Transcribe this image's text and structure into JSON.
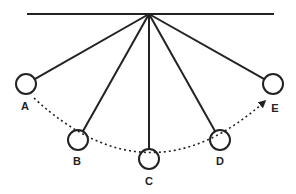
{
  "diagram": {
    "title": "",
    "colors": {
      "line": "#222222",
      "background": "#ffffff"
    },
    "ceiling": {
      "x1": 27,
      "y1": 14,
      "x2": 274,
      "y2": 14
    },
    "pivot": {
      "x": 149,
      "y": 14
    },
    "bob_radius": 10,
    "positions": [
      {
        "id": "A",
        "label": "A",
        "cx": 26,
        "cy": 84,
        "label_x": 25,
        "label_y": 110
      },
      {
        "id": "B",
        "label": "B",
        "cx": 78,
        "cy": 140,
        "label_x": 77,
        "label_y": 165
      },
      {
        "id": "C",
        "label": "C",
        "cx": 149,
        "cy": 159,
        "label_x": 149,
        "label_y": 185
      },
      {
        "id": "D",
        "label": "D",
        "cx": 220,
        "cy": 140,
        "label_x": 220,
        "label_y": 165
      },
      {
        "id": "E",
        "label": "E",
        "cx": 273,
        "cy": 84,
        "label_x": 275,
        "label_y": 112
      }
    ],
    "path": {
      "style": "dotted",
      "from": "A",
      "to": "E",
      "arrow_at": "E",
      "d": "M 34 98 Q 149 205 264 102"
    }
  }
}
